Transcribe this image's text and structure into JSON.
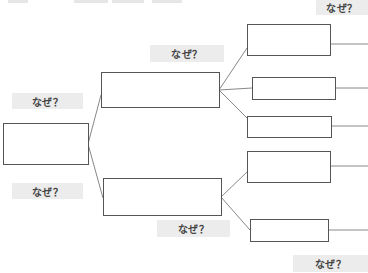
{
  "diagram": {
    "type": "why-why-analysis-tree",
    "colors": {
      "box_border": "#555555",
      "connector": "#888888",
      "label_bg": "#ececec",
      "label_text": "#444444"
    },
    "labels": {
      "why_top_right": "なぜ？",
      "why_mid_top": "なぜ？",
      "why_left_top": "なぜ？",
      "why_left_bottom": "なぜ？",
      "why_mid_bottom": "なぜ？",
      "why_bottom_right": "なぜ？"
    },
    "nodes": {
      "root": "",
      "level1": [
        "",
        ""
      ],
      "level2": [
        "",
        "",
        "",
        "",
        ""
      ]
    }
  }
}
